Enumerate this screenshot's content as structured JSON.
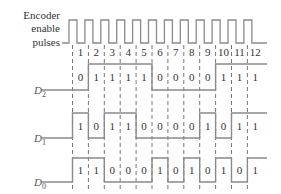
{
  "labels": {
    "encoder_line1": "Encoder",
    "encoder_line2": "enable",
    "encoder_line3": "pulses",
    "d2": "D",
    "d2_sub": "2",
    "d1": "D",
    "d1_sub": "1",
    "d0": "D",
    "d0_sub": "0"
  },
  "pulse_numbers": [
    "1",
    "2",
    "3",
    "4",
    "5",
    "6",
    "7",
    "8",
    "9",
    "10",
    "11",
    "12"
  ],
  "signals": {
    "D2": [
      0,
      1,
      1,
      1,
      1,
      0,
      0,
      0,
      0,
      1,
      1,
      1
    ],
    "D1": [
      1,
      0,
      1,
      1,
      0,
      0,
      0,
      0,
      1,
      0,
      1,
      1
    ],
    "D0": [
      1,
      1,
      0,
      0,
      0,
      1,
      0,
      1,
      0,
      1,
      0,
      1
    ]
  },
  "colors": {
    "waveform": "#8a8a8a",
    "text": "#333333",
    "dash": "#777777"
  }
}
